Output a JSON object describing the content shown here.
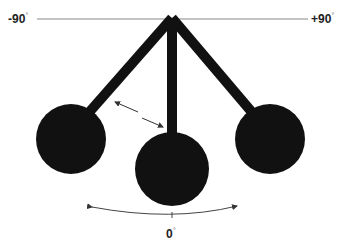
{
  "labels": {
    "left_angle": "-90",
    "right_angle": "+90",
    "bottom_angle": "0",
    "degree_symbol": "°"
  },
  "colors": {
    "ink": "#111111",
    "line": "#777777",
    "background": "#ffffff"
  },
  "pendulums": [
    {
      "position": "left",
      "angle": "-45"
    },
    {
      "position": "center",
      "angle": "0"
    },
    {
      "position": "right",
      "angle": "+45"
    }
  ]
}
